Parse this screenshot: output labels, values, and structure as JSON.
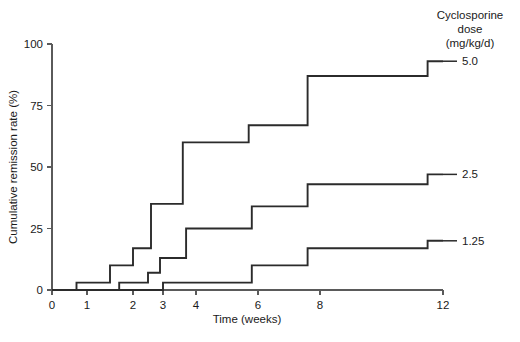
{
  "chart_data": {
    "type": "line",
    "subtype": "step-post",
    "title": "",
    "xlabel": "Time (weeks)",
    "ylabel": "Cumulative remission rate (%)",
    "xlim": [
      0,
      12
    ],
    "ylim": [
      0,
      100
    ],
    "xticks": [
      0,
      1,
      2,
      3,
      4,
      6,
      8,
      12
    ],
    "xticklabels": [
      "0",
      "1",
      "2",
      "3",
      "4",
      "6",
      "8",
      "12"
    ],
    "x_axis_scale": "nonlinear-compressed-after-4",
    "yticks": [
      0,
      25,
      50,
      75,
      100
    ],
    "yticklabels": [
      "0",
      "25",
      "50",
      "75",
      "100"
    ],
    "grid": false,
    "legend_position": "right",
    "legend_title": "Cyclosporine dose (mg/kg/d)",
    "legend_title_lines": [
      "Cyclosporine",
      "dose",
      "(mg/kg/d)"
    ],
    "series": [
      {
        "name": "5.0",
        "label": "5.0",
        "label_value_pct": 93,
        "steps": [
          {
            "x": 0.0,
            "y": 0
          },
          {
            "x": 0.7,
            "y": 3
          },
          {
            "x": 1.5,
            "y": 10
          },
          {
            "x": 2.0,
            "y": 17
          },
          {
            "x": 2.6,
            "y": 35
          },
          {
            "x": 3.6,
            "y": 60
          },
          {
            "x": 5.7,
            "y": 67
          },
          {
            "x": 7.6,
            "y": 87
          },
          {
            "x": 11.5,
            "y": 93
          },
          {
            "x": 12.0,
            "y": 93
          }
        ]
      },
      {
        "name": "2.5",
        "label": "2.5",
        "label_value_pct": 47,
        "steps": [
          {
            "x": 0.0,
            "y": 0
          },
          {
            "x": 1.7,
            "y": 3
          },
          {
            "x": 2.5,
            "y": 7
          },
          {
            "x": 2.9,
            "y": 13
          },
          {
            "x": 3.7,
            "y": 25
          },
          {
            "x": 5.8,
            "y": 34
          },
          {
            "x": 7.6,
            "y": 43
          },
          {
            "x": 11.5,
            "y": 47
          },
          {
            "x": 12.0,
            "y": 47
          }
        ]
      },
      {
        "name": "1.25",
        "label": "1.25",
        "label_value_pct": 20,
        "steps": [
          {
            "x": 0.0,
            "y": 0
          },
          {
            "x": 3.0,
            "y": 3
          },
          {
            "x": 5.8,
            "y": 10
          },
          {
            "x": 7.6,
            "y": 17
          },
          {
            "x": 11.5,
            "y": 20
          },
          {
            "x": 12.0,
            "y": 20
          }
        ]
      }
    ]
  },
  "colors": {
    "curve": "#2b2b2b",
    "axis": "#5a5a5a",
    "text": "#1a1a1a",
    "background": "#ffffff"
  }
}
